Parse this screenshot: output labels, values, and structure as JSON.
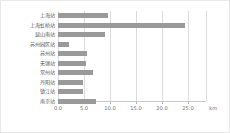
{
  "chart_data": {
    "type": "bar",
    "orientation": "horizontal",
    "title": "",
    "xlabel": "km",
    "ylabel": "",
    "xlim": [
      0.0,
      28.5
    ],
    "grid": true,
    "legend": null,
    "bar_color": "#9a9a9a",
    "gridline_color": "#dcdcdc",
    "unit": "km",
    "xticks": [
      "0.0",
      "5.0",
      "10.0",
      "15.0",
      "20.0",
      "25.0"
    ],
    "xtick_values": [
      0.0,
      5.0,
      10.0,
      15.0,
      20.0,
      25.0
    ],
    "categories": [
      "上海站",
      "上海虹桥站",
      "昆山南站",
      "苏州园区站",
      "苏州站",
      "无锡站",
      "常州站",
      "丹阳站",
      "镇江站",
      "南京站"
    ],
    "values": [
      9.6,
      24.4,
      9.1,
      2.2,
      5.6,
      5.4,
      6.8,
      4.8,
      4.8,
      7.4
    ]
  }
}
